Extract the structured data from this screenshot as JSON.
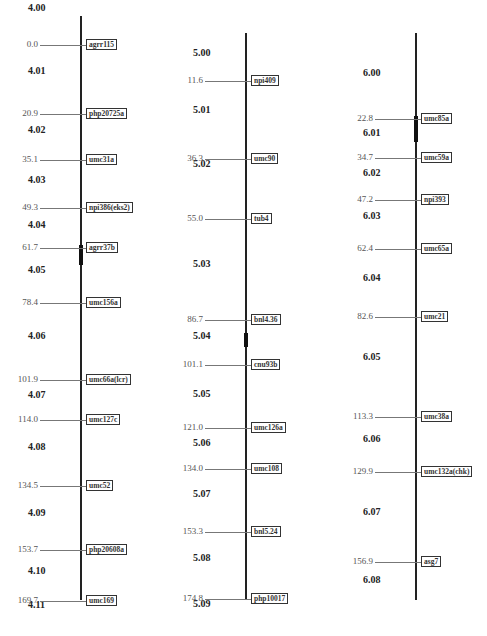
{
  "chart_data": {
    "type": "genetic_linkage_map",
    "chromosomes": [
      {
        "id": "4",
        "axis": {
          "x": 80,
          "top": 16,
          "bottom": 600
        },
        "centromere": {
          "y_top": 245,
          "y_bottom": 265
        },
        "bins": [
          {
            "label": "4.00",
            "y": 8
          },
          {
            "label": "4.01",
            "y": 71
          },
          {
            "label": "4.02",
            "y": 130
          },
          {
            "label": "4.03",
            "y": 180
          },
          {
            "label": "4.04",
            "y": 225
          },
          {
            "label": "4.05",
            "y": 270
          },
          {
            "label": "4.06",
            "y": 336
          },
          {
            "label": "4.07",
            "y": 395
          },
          {
            "label": "4.08",
            "y": 447
          },
          {
            "label": "4.09",
            "y": 513
          },
          {
            "label": "4.10",
            "y": 571
          },
          {
            "label": "4.11",
            "y": 605
          }
        ],
        "markers": [
          {
            "pos": "0.0",
            "name": "agrr115",
            "y": 45
          },
          {
            "pos": "20.9",
            "name": "php20725a",
            "y": 114
          },
          {
            "pos": "35.1",
            "name": "umc31a",
            "y": 160
          },
          {
            "pos": "49.3",
            "name": "npi386(eks2)",
            "y": 208
          },
          {
            "pos": "61.7",
            "name": "agrr37b",
            "y": 248
          },
          {
            "pos": "78.4",
            "name": "umc156a",
            "y": 303
          },
          {
            "pos": "101.9",
            "name": "umc66a(lcr)",
            "y": 380
          },
          {
            "pos": "114.0",
            "name": "umc127c",
            "y": 420
          },
          {
            "pos": "134.5",
            "name": "umc52",
            "y": 486
          },
          {
            "pos": "153.7",
            "name": "php20608a",
            "y": 550
          },
          {
            "pos": "169.7",
            "name": "umc169",
            "y": 601
          }
        ]
      },
      {
        "id": "5",
        "axis": {
          "x": 245,
          "top": 33,
          "bottom": 600
        },
        "centromere": {
          "y_top": 333,
          "y_bottom": 347
        },
        "bins": [
          {
            "label": "5.00",
            "y": 53
          },
          {
            "label": "5.01",
            "y": 110
          },
          {
            "label": "5.02",
            "y": 164
          },
          {
            "label": "5.03",
            "y": 264
          },
          {
            "label": "5.04",
            "y": 336
          },
          {
            "label": "5.05",
            "y": 394
          },
          {
            "label": "5.06",
            "y": 443
          },
          {
            "label": "5.07",
            "y": 494
          },
          {
            "label": "5.08",
            "y": 558
          },
          {
            "label": "5.09",
            "y": 604
          }
        ],
        "markers": [
          {
            "pos": "11.6",
            "name": "npi409",
            "y": 81
          },
          {
            "pos": "36.3",
            "name": "umc90",
            "y": 159
          },
          {
            "pos": "55.0",
            "name": "tub4",
            "y": 219
          },
          {
            "pos": "86.7",
            "name": "bnl4.36",
            "y": 320
          },
          {
            "pos": "101.1",
            "name": "cnu93b",
            "y": 365
          },
          {
            "pos": "121.0",
            "name": "umc126a",
            "y": 428
          },
          {
            "pos": "134.0",
            "name": "umc108",
            "y": 469
          },
          {
            "pos": "153.3",
            "name": "bnl5.24",
            "y": 532
          },
          {
            "pos": "174.8",
            "name": "php10017",
            "y": 599
          }
        ]
      },
      {
        "id": "6",
        "axis": {
          "x": 415,
          "top": 33,
          "bottom": 600
        },
        "centromere": {
          "y_top": 116,
          "y_bottom": 142
        },
        "bins": [
          {
            "label": "6.00",
            "y": 73
          },
          {
            "label": "6.01",
            "y": 133
          },
          {
            "label": "6.02",
            "y": 173
          },
          {
            "label": "6.03",
            "y": 216
          },
          {
            "label": "6.04",
            "y": 278
          },
          {
            "label": "6.05",
            "y": 357
          },
          {
            "label": "6.06",
            "y": 439
          },
          {
            "label": "6.07",
            "y": 512
          },
          {
            "label": "6.08",
            "y": 580
          }
        ],
        "markers": [
          {
            "pos": "22.8",
            "name": "umc85a",
            "y": 119
          },
          {
            "pos": "34.7",
            "name": "umc59a",
            "y": 158
          },
          {
            "pos": "47.2",
            "name": "npi393",
            "y": 200
          },
          {
            "pos": "62.4",
            "name": "umc65a",
            "y": 249
          },
          {
            "pos": "82.6",
            "name": "umc21",
            "y": 317
          },
          {
            "pos": "113.3",
            "name": "umc38a",
            "y": 417
          },
          {
            "pos": "129.9",
            "name": "umc132a(chk)",
            "y": 472
          },
          {
            "pos": "156.9",
            "name": "asg7",
            "y": 562
          }
        ]
      }
    ]
  }
}
